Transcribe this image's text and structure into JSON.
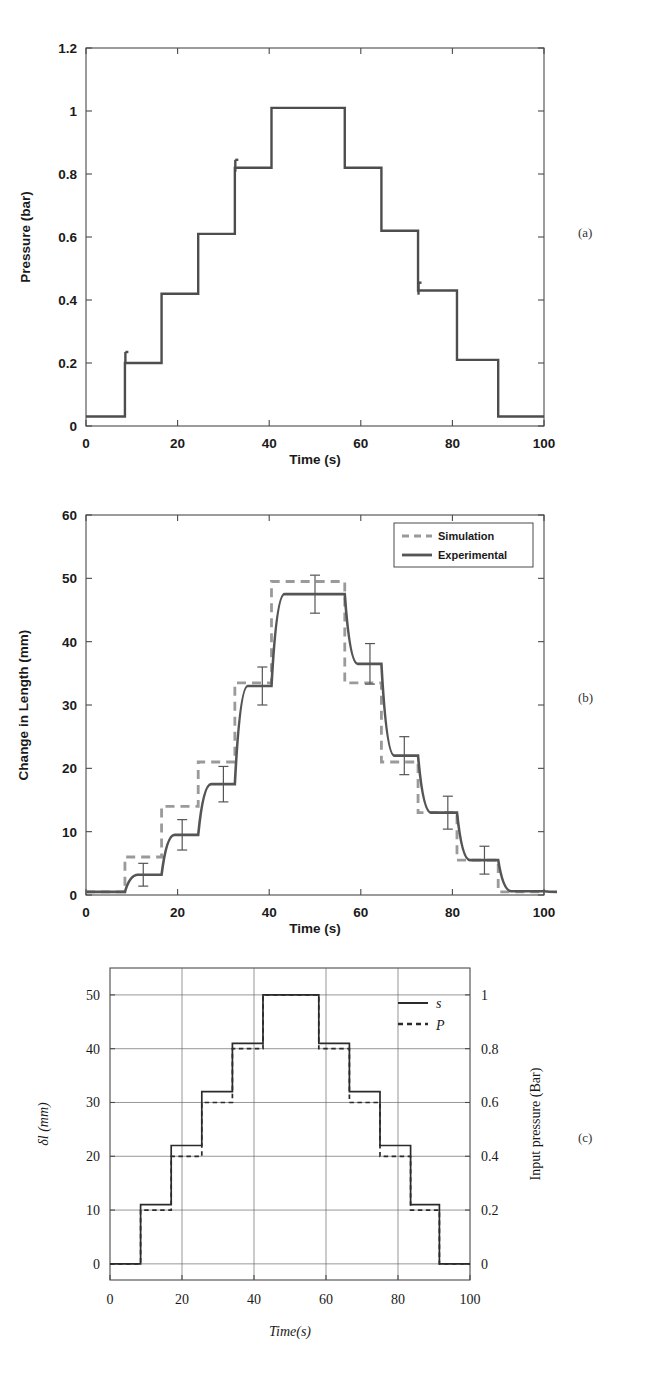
{
  "figure": {
    "panel_labels": {
      "a": "(a)",
      "b": "(b)",
      "c": "(c)"
    }
  },
  "chart_data": [
    {
      "id": "panel_a",
      "type": "line",
      "title": "",
      "xlabel": "Time (s)",
      "ylabel": "Pressure (bar)",
      "xlim": [
        0,
        100
      ],
      "ylim": [
        0,
        1.2
      ],
      "xticks": [
        0,
        20,
        40,
        60,
        80,
        100
      ],
      "xticklabels": [
        "0",
        "20",
        "40",
        "60",
        "80",
        "100"
      ],
      "yticks": [
        0,
        0.2,
        0.4,
        0.6,
        0.8,
        1,
        1.2
      ],
      "yticklabels": [
        "0",
        "0.2",
        "0.4",
        "0.6",
        "0.8",
        "1",
        "1.2"
      ],
      "grid": false,
      "legend": null,
      "series": [
        {
          "name": "Pressure",
          "style": "solid",
          "color": "#4d4d4d",
          "step_times": [
            0,
            8.5,
            16.5,
            24.5,
            32.5,
            40.5,
            56.5,
            64.5,
            72.5,
            81,
            90,
            100
          ],
          "step_values": [
            0.03,
            0.2,
            0.42,
            0.61,
            0.82,
            1.01,
            0.82,
            0.62,
            0.43,
            0.21,
            0.03,
            0.03
          ],
          "overshoots": [
            {
              "time": 8.6,
              "value": 0.235
            },
            {
              "time": 32.6,
              "value": 0.845
            },
            {
              "time": 72.6,
              "value": 0.455
            }
          ]
        }
      ]
    },
    {
      "id": "panel_b",
      "type": "line",
      "title": "",
      "xlabel": "Time (s)",
      "ylabel": "Change in Length (mm)",
      "xlim": [
        0,
        100
      ],
      "ylim": [
        0,
        60
      ],
      "xticks": [
        0,
        20,
        40,
        60,
        80,
        100
      ],
      "xticklabels": [
        "0",
        "20",
        "40",
        "60",
        "80",
        "100"
      ],
      "yticks": [
        0,
        10,
        20,
        30,
        40,
        50,
        60
      ],
      "yticklabels": [
        "0",
        "10",
        "20",
        "30",
        "40",
        "50",
        "60"
      ],
      "grid": false,
      "legend": {
        "position": "top-right",
        "entries": [
          "Simulation",
          "Experimental"
        ]
      },
      "series": [
        {
          "name": "Simulation",
          "style": "dashed",
          "color": "#9a9a9a",
          "step_times": [
            0,
            8.5,
            16.5,
            24.5,
            32.5,
            40.5,
            56.5,
            64.5,
            72.5,
            81,
            90,
            100
          ],
          "step_values": [
            0.5,
            6.0,
            14.0,
            21.0,
            33.5,
            49.5,
            33.5,
            21.0,
            13.0,
            5.5,
            0.5,
            0.5
          ]
        },
        {
          "name": "Experimental",
          "style": "solid",
          "color": "#555555",
          "step_times": [
            0,
            8.5,
            16.5,
            24.5,
            32.5,
            40.5,
            56.5,
            64.5,
            72.5,
            81,
            90,
            100
          ],
          "step_values": [
            0.5,
            3.2,
            9.5,
            17.5,
            33.0,
            47.5,
            36.5,
            22.0,
            13.0,
            5.5,
            0.6,
            0.5
          ]
        }
      ],
      "error_bars": [
        {
          "x": 12.5,
          "y": 3.2,
          "err": 1.8
        },
        {
          "x": 21.0,
          "y": 9.5,
          "err": 2.4
        },
        {
          "x": 30.0,
          "y": 17.5,
          "err": 2.8
        },
        {
          "x": 38.5,
          "y": 33.0,
          "err": 3.0
        },
        {
          "x": 50.0,
          "y": 47.5,
          "err": 3.0
        },
        {
          "x": 62.0,
          "y": 36.5,
          "err": 3.2
        },
        {
          "x": 69.5,
          "y": 22.0,
          "err": 3.0
        },
        {
          "x": 79.0,
          "y": 13.0,
          "err": 2.6
        },
        {
          "x": 87.0,
          "y": 5.5,
          "err": 2.2
        }
      ]
    },
    {
      "id": "panel_c",
      "type": "line",
      "title": "",
      "xlabel": "Time(s)",
      "ylabel_left": "δl (mm)",
      "ylabel_right": "Input pressure (Bar)",
      "xlim": [
        0,
        100
      ],
      "ylim_left": [
        -3,
        55
      ],
      "ylim_right": [
        -0.06,
        1.1
      ],
      "xticks": [
        0,
        20,
        40,
        60,
        80,
        100
      ],
      "xticklabels": [
        "0",
        "20",
        "40",
        "60",
        "80",
        "100"
      ],
      "yticks_left": [
        0,
        10,
        20,
        30,
        40,
        50
      ],
      "yticklabels_left": [
        "0",
        "10",
        "20",
        "30",
        "40",
        "50"
      ],
      "yticks_right": [
        0,
        0.2,
        0.4,
        0.6,
        0.8,
        1
      ],
      "yticklabels_right": [
        "0",
        "0.2",
        "0.4",
        "0.6",
        "0.8",
        "1"
      ],
      "grid": true,
      "legend": {
        "position": "right",
        "entries": [
          "s",
          "P"
        ]
      },
      "series": [
        {
          "name": "s",
          "style": "solid",
          "color": "#2b2b2b",
          "step_times": [
            0,
            8.5,
            17,
            25.5,
            34,
            42.5,
            58,
            66.5,
            75,
            83.5,
            91.5,
            100
          ],
          "step_values": [
            0,
            11,
            22,
            32,
            41,
            50,
            41,
            32,
            22,
            11,
            0,
            0
          ]
        },
        {
          "name": "P",
          "style": "dashed",
          "color": "#2b2b2b",
          "step_times": [
            0,
            8.5,
            17,
            25.5,
            34,
            42.5,
            58,
            66.5,
            75,
            83.5,
            91.5,
            100
          ],
          "step_values_pressure": [
            0,
            0.2,
            0.4,
            0.6,
            0.8,
            1.0,
            0.8,
            0.6,
            0.4,
            0.2,
            0,
            0
          ]
        }
      ]
    }
  ]
}
